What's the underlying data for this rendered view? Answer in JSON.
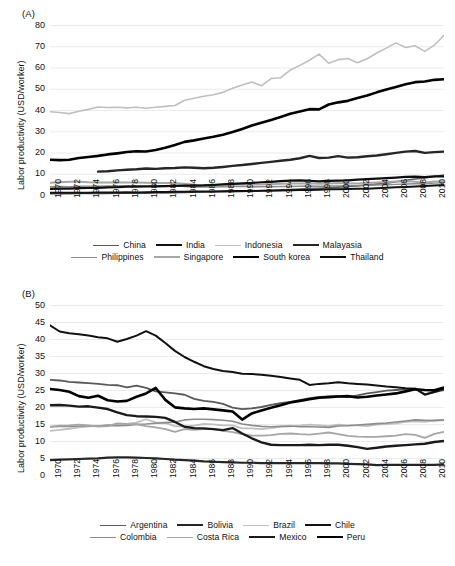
{
  "figure": {
    "panels": [
      "A",
      "B"
    ],
    "background": "#ffffff"
  },
  "panel_a": {
    "tag": "(A)",
    "ylabel": "Labor productivity (USD/worker)",
    "legend": [
      {
        "label": "China",
        "color": "#595959",
        "width": 1.6
      },
      {
        "label": "India",
        "color": "#111111",
        "width": 2.0
      },
      {
        "label": "Indonesia",
        "color": "#bfbfbf",
        "width": 1.6
      },
      {
        "label": "Malayasia",
        "color": "#262626",
        "width": 2.4
      },
      {
        "label": "Philippines",
        "color": "#8c8c8c",
        "width": 1.4
      },
      {
        "label": "Singapore",
        "color": "#a6a6a6",
        "width": 2.0
      },
      {
        "label": "South korea",
        "color": "#000000",
        "width": 2.6
      },
      {
        "label": "Thailand",
        "color": "#0d0d0d",
        "width": 2.2
      }
    ]
  },
  "panel_b": {
    "tag": "(B)",
    "ylabel": "Labor productivity (USD/worker)",
    "legend": [
      {
        "label": "Argentina",
        "color": "#595959",
        "width": 1.8
      },
      {
        "label": "Bolivia",
        "color": "#262626",
        "width": 2.2
      },
      {
        "label": "Brazil",
        "color": "#bfbfbf",
        "width": 1.8
      },
      {
        "label": "Chile",
        "color": "#111111",
        "width": 2.0
      },
      {
        "label": "Colombia",
        "color": "#8c8c8c",
        "width": 1.6
      },
      {
        "label": "Costa Rica",
        "color": "#a6a6a6",
        "width": 1.8
      },
      {
        "label": "Mexico",
        "color": "#1a1a1a",
        "width": 2.4
      },
      {
        "label": "Peru",
        "color": "#000000",
        "width": 2.6
      }
    ]
  },
  "chart_data": [
    {
      "panel": "A",
      "type": "line",
      "title": "(A)",
      "xlabel": "",
      "ylabel": "Labor productivity (USD/worker)",
      "ylim": [
        0,
        80
      ],
      "yticks": [
        0,
        10,
        20,
        30,
        40,
        50,
        60,
        70,
        80
      ],
      "xlim": [
        1970,
        2011
      ],
      "xticks": [
        1970,
        1972,
        1974,
        1976,
        1978,
        1980,
        1982,
        1984,
        1986,
        1988,
        1990,
        1992,
        1994,
        1996,
        1998,
        2000,
        2002,
        2004,
        2006,
        2008,
        2010
      ],
      "x": [
        1970,
        1971,
        1972,
        1973,
        1974,
        1975,
        1976,
        1977,
        1978,
        1979,
        1980,
        1981,
        1982,
        1983,
        1984,
        1985,
        1986,
        1987,
        1988,
        1989,
        1990,
        1991,
        1992,
        1993,
        1994,
        1995,
        1996,
        1997,
        1998,
        1999,
        2000,
        2001,
        2002,
        2003,
        2004,
        2005,
        2006,
        2007,
        2008,
        2009,
        2010,
        2011
      ],
      "grid": true,
      "legend_position": "below",
      "series": [
        {
          "name": "China",
          "color": "#595959",
          "values": [
            0.6,
            0.6,
            0.6,
            0.7,
            0.7,
            0.7,
            0.7,
            0.8,
            0.8,
            0.9,
            0.9,
            1.0,
            1.0,
            1.1,
            1.2,
            1.3,
            1.4,
            1.5,
            1.6,
            1.6,
            1.7,
            1.8,
            2.0,
            2.2,
            2.4,
            2.6,
            2.8,
            3.0,
            3.2,
            3.4,
            3.7,
            4.0,
            4.3,
            4.7,
            5.1,
            5.6,
            6.2,
            6.9,
            7.5,
            8.0,
            8.7,
            9.4
          ]
        },
        {
          "name": "India",
          "color": "#111111",
          "values": [
            1.1,
            1.1,
            1.1,
            1.1,
            1.1,
            1.2,
            1.2,
            1.2,
            1.3,
            1.2,
            1.3,
            1.4,
            1.4,
            1.5,
            1.5,
            1.6,
            1.6,
            1.6,
            1.8,
            1.9,
            1.9,
            1.9,
            2.0,
            2.0,
            2.1,
            2.2,
            2.4,
            2.4,
            2.5,
            2.7,
            2.7,
            2.8,
            2.9,
            3.0,
            3.2,
            3.4,
            3.6,
            3.8,
            4.0,
            4.2,
            4.5,
            4.7
          ]
        },
        {
          "name": "Indonesia",
          "color": "#bfbfbf",
          "values": [
            39.2,
            38.8,
            38.3,
            39.4,
            40.3,
            41.4,
            41.2,
            41.3,
            41.0,
            41.3,
            40.8,
            41.3,
            41.7,
            42.1,
            44.6,
            45.5,
            46.5,
            47.2,
            48.3,
            50.2,
            51.8,
            53.2,
            51.4,
            54.8,
            55.2,
            58.8,
            61.0,
            63.4,
            66.3,
            62.0,
            63.7,
            64.2,
            62.2,
            64.1,
            66.8,
            69.1,
            71.6,
            69.4,
            70.2,
            67.6,
            70.5,
            75.2
          ]
        },
        {
          "name": "Malayasia",
          "color": "#262626",
          "values": [
            null,
            null,
            null,
            null,
            null,
            11.0,
            11.2,
            11.6,
            11.9,
            12.1,
            12.5,
            12.3,
            12.6,
            12.7,
            13.0,
            12.8,
            12.6,
            12.8,
            13.2,
            13.7,
            14.1,
            14.6,
            15.1,
            15.6,
            16.1,
            16.6,
            17.3,
            18.4,
            17.4,
            17.6,
            18.3,
            17.6,
            17.8,
            18.2,
            18.6,
            19.2,
            19.8,
            20.4,
            20.7,
            19.8,
            20.2,
            20.4
          ]
        },
        {
          "name": "Philippines",
          "color": "#8c8c8c",
          "values": [
            3.9,
            4.0,
            3.9,
            4.1,
            4.1,
            4.1,
            4.2,
            4.2,
            4.3,
            4.4,
            4.4,
            4.4,
            4.4,
            4.4,
            4.0,
            3.8,
            3.8,
            3.8,
            3.9,
            4.0,
            4.0,
            3.9,
            3.9,
            3.9,
            4.0,
            4.0,
            4.1,
            4.2,
            4.1,
            4.2,
            4.3,
            4.4,
            4.4,
            4.6,
            4.7,
            4.8,
            5.0,
            5.2,
            5.3,
            5.3,
            5.6,
            5.7
          ]
        },
        {
          "name": "Singapore",
          "color": "#a6a6a6",
          "values": [
            5.8,
            6.0,
            6.2,
            6.2,
            6.0,
            5.9,
            5.9,
            5.9,
            5.9,
            5.9,
            5.8,
            5.7,
            5.6,
            5.5,
            5.3,
            4.8,
            4.7,
            4.8,
            4.9,
            5.0,
            5.1,
            5.0,
            5.0,
            5.1,
            5.3,
            5.4,
            5.4,
            5.5,
            5.3,
            5.4,
            5.6,
            5.4,
            5.4,
            5.6,
            5.9,
            6.1,
            6.3,
            6.5,
            6.2,
            5.8,
            6.3,
            6.4
          ]
        },
        {
          "name": "South korea",
          "color": "#000000",
          "values": [
            16.6,
            16.4,
            16.6,
            17.4,
            17.9,
            18.4,
            19.1,
            19.6,
            20.2,
            20.6,
            20.5,
            21.2,
            22.2,
            23.5,
            25.0,
            25.7,
            26.6,
            27.4,
            28.4,
            29.6,
            31.1,
            32.7,
            34.0,
            35.3,
            36.7,
            38.2,
            39.3,
            40.4,
            40.3,
            42.6,
            43.6,
            44.3,
            45.7,
            46.8,
            48.3,
            49.6,
            50.8,
            52.1,
            53.1,
            53.4,
            54.2,
            54.5
          ]
        },
        {
          "name": "Thailand",
          "color": "#0d0d0d",
          "values": [
            2.9,
            3.0,
            3.0,
            3.2,
            3.3,
            3.4,
            3.6,
            3.7,
            3.9,
            3.9,
            4.0,
            4.1,
            4.2,
            4.3,
            4.4,
            4.4,
            4.5,
            4.7,
            5.0,
            5.2,
            5.5,
            5.7,
            6.0,
            6.2,
            6.5,
            6.8,
            6.9,
            6.7,
            6.4,
            6.6,
            6.8,
            6.9,
            7.2,
            7.5,
            7.7,
            7.9,
            8.2,
            8.5,
            8.6,
            8.4,
            8.8,
            8.8
          ]
        }
      ]
    },
    {
      "panel": "B",
      "type": "line",
      "title": "(B)",
      "xlabel": "",
      "ylabel": "Labor productivity (USD/worker)",
      "ylim": [
        0,
        50
      ],
      "yticks": [
        0,
        5,
        10,
        15,
        20,
        25,
        30,
        35,
        40,
        45,
        50
      ],
      "xlim": [
        1970,
        2011
      ],
      "xticks": [
        1970,
        1972,
        1974,
        1976,
        1978,
        1980,
        1982,
        1984,
        1986,
        1988,
        1990,
        1992,
        1994,
        1996,
        1998,
        2000,
        2002,
        2004,
        2006,
        2008,
        2010
      ],
      "x": [
        1970,
        1971,
        1972,
        1973,
        1974,
        1975,
        1976,
        1977,
        1978,
        1979,
        1980,
        1981,
        1982,
        1983,
        1984,
        1985,
        1986,
        1987,
        1988,
        1989,
        1990,
        1991,
        1992,
        1993,
        1994,
        1995,
        1996,
        1997,
        1998,
        1999,
        2000,
        2001,
        2002,
        2003,
        2004,
        2005,
        2006,
        2007,
        2008,
        2009,
        2010,
        2011
      ],
      "grid": true,
      "legend_position": "below",
      "series": [
        {
          "name": "Argentina",
          "color": "#595959",
          "values": [
            28.0,
            27.8,
            27.4,
            27.2,
            27.0,
            26.8,
            26.5,
            26.4,
            25.8,
            26.3,
            25.6,
            24.6,
            24.3,
            24.0,
            23.6,
            22.4,
            21.8,
            21.5,
            20.9,
            19.8,
            19.4,
            19.6,
            20.0,
            20.6,
            21.1,
            21.5,
            22.0,
            22.6,
            23.0,
            23.1,
            23.2,
            22.9,
            23.4,
            24.0,
            24.4,
            24.8,
            25.0,
            25.2,
            25.4,
            23.8,
            24.4,
            25.0
          ]
        },
        {
          "name": "Bolivia",
          "color": "#262626",
          "values": [
            4.4,
            4.5,
            4.6,
            4.7,
            4.8,
            4.9,
            5.1,
            5.2,
            5.2,
            5.1,
            5.0,
            4.9,
            4.7,
            4.5,
            4.4,
            4.2,
            4.0,
            3.9,
            3.8,
            3.7,
            3.6,
            3.6,
            3.5,
            3.5,
            3.5,
            3.5,
            3.5,
            3.5,
            3.5,
            3.4,
            3.4,
            3.3,
            3.2,
            3.1,
            2.9,
            3.0,
            3.0,
            3.0,
            3.0,
            3.0,
            3.0,
            3.1
          ]
        },
        {
          "name": "Brazil",
          "color": "#bfbfbf",
          "values": [
            13.0,
            13.3,
            13.6,
            14.0,
            14.3,
            14.4,
            14.7,
            14.8,
            15.0,
            15.4,
            16.4,
            15.5,
            15.3,
            14.4,
            14.2,
            14.5,
            15.0,
            14.9,
            14.6,
            14.6,
            13.7,
            13.7,
            13.5,
            13.8,
            14.2,
            14.3,
            14.5,
            14.8,
            14.6,
            14.4,
            14.8,
            14.6,
            14.6,
            14.4,
            14.8,
            15.0,
            15.2,
            15.6,
            15.8,
            15.6,
            16.1,
            16.1
          ]
        },
        {
          "name": "Chile",
          "color": "#111111",
          "values": [
            44.0,
            42.2,
            41.7,
            41.4,
            41.0,
            40.5,
            40.2,
            39.2,
            40.0,
            41.0,
            42.3,
            41.0,
            38.8,
            36.5,
            34.7,
            33.3,
            32.0,
            31.2,
            30.6,
            30.3,
            29.8,
            29.7,
            29.5,
            29.2,
            28.8,
            28.4,
            28.0,
            26.5,
            26.8,
            27.0,
            27.3,
            27.0,
            26.8,
            26.6,
            26.3,
            26.0,
            25.8,
            25.5,
            25.4,
            23.6,
            24.4,
            25.4
          ]
        },
        {
          "name": "Colombia",
          "color": "#8c8c8c",
          "values": [
            14.1,
            14.3,
            14.3,
            14.4,
            14.5,
            14.4,
            14.6,
            14.5,
            14.6,
            14.9,
            15.0,
            15.2,
            15.4,
            15.6,
            16.2,
            16.4,
            16.4,
            16.3,
            16.1,
            15.8,
            15.0,
            14.6,
            14.3,
            14.2,
            14.3,
            14.4,
            14.2,
            14.2,
            14.1,
            14.0,
            14.4,
            14.5,
            14.7,
            14.9,
            15.1,
            15.3,
            15.6,
            15.9,
            16.2,
            16.1,
            16.0,
            16.2
          ]
        },
        {
          "name": "Costa Rica",
          "color": "#a6a6a6",
          "values": [
            14.2,
            14.5,
            14.6,
            14.8,
            14.6,
            14.2,
            14.4,
            15.2,
            15.0,
            14.9,
            14.4,
            14.0,
            13.5,
            12.7,
            13.5,
            13.3,
            13.5,
            13.5,
            13.0,
            12.6,
            12.0,
            11.6,
            11.6,
            11.7,
            12.1,
            12.2,
            12.0,
            11.9,
            12.2,
            12.5,
            12.0,
            11.5,
            11.3,
            11.2,
            11.2,
            11.4,
            11.6,
            12.0,
            11.8,
            10.9,
            12.1,
            12.7
          ]
        },
        {
          "name": "Mexico",
          "color": "#1a1a1a",
          "values": [
            20.5,
            20.6,
            20.4,
            20.1,
            20.2,
            19.8,
            19.4,
            18.4,
            17.6,
            17.3,
            17.2,
            17.1,
            16.8,
            15.6,
            14.2,
            13.8,
            13.7,
            13.5,
            13.2,
            13.8,
            12.2,
            10.8,
            9.6,
            8.9,
            8.8,
            8.8,
            8.8,
            8.9,
            8.8,
            8.9,
            8.9,
            8.6,
            8.2,
            7.7,
            8.0,
            8.4,
            8.6,
            8.8,
            9.0,
            9.2,
            9.7,
            10.0
          ]
        },
        {
          "name": "Peru",
          "color": "#000000",
          "values": [
            25.3,
            25.0,
            24.5,
            23.2,
            22.7,
            23.3,
            22.0,
            21.6,
            21.8,
            23.0,
            24.0,
            25.6,
            22.1,
            19.9,
            19.6,
            19.4,
            19.6,
            19.3,
            19.0,
            18.7,
            16.3,
            18.1,
            19.0,
            19.8,
            20.5,
            21.3,
            21.8,
            22.3,
            22.7,
            22.9,
            23.1,
            23.2,
            22.8,
            23.0,
            23.4,
            23.7,
            24.0,
            24.6,
            25.2,
            25.0,
            24.9,
            25.7
          ]
        }
      ]
    }
  ]
}
